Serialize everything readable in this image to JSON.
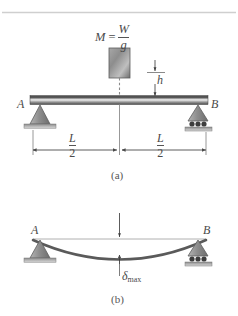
{
  "figure": {
    "title_top_rule": "",
    "panels": [
      {
        "caption": "(a)",
        "name": "simply-supported-beam-with-falling-mass",
        "labels": {
          "support_left": "A",
          "support_right": "B",
          "mass_symbol": "M",
          "equals": "=",
          "mass_numerator": "W",
          "mass_denominator": "g",
          "drop_height": "h",
          "dim_left_numerator": "L",
          "dim_left_denominator": "2",
          "dim_right_numerator": "L",
          "dim_right_denominator": "2"
        }
      },
      {
        "caption": "(b)",
        "name": "deflected-beam-shape",
        "labels": {
          "support_left": "A",
          "support_right": "B",
          "deflection_symbol": "δ",
          "deflection_subscript": "max"
        }
      }
    ]
  },
  "colors": {
    "beam_dark": "#4e4e4e",
    "beam_light": "#e8e8e8",
    "support_fill": "#9a9a9a",
    "line": "#4a4a4a",
    "rule": "#c9c9c9",
    "text": "#4a4a4a",
    "ground": "#bdbdbd",
    "curve": "#5a5a5a"
  }
}
